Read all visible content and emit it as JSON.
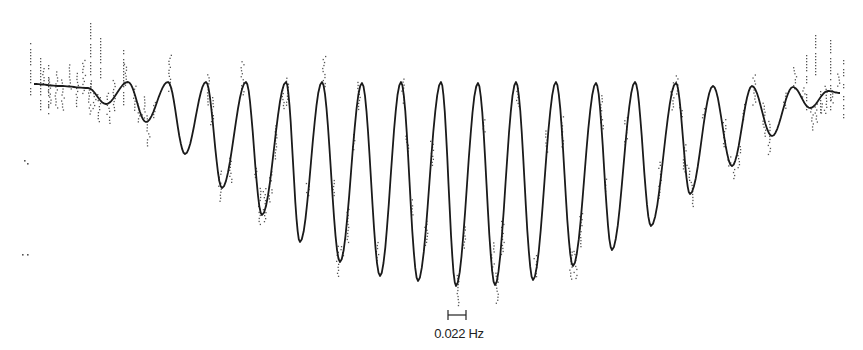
{
  "chart_data": {
    "type": "line",
    "title": "",
    "xlabel": "",
    "ylabel": "",
    "grid": false,
    "legend": null,
    "scale_bar": {
      "label": "0.022 Hz",
      "x_px": [
        448,
        466
      ],
      "y_px": 315
    },
    "series": [
      {
        "name": "fit",
        "style": "solid",
        "color": "#1a1a1a",
        "points_px": [
          [
            34,
            84
          ],
          [
            60,
            86
          ],
          [
            88,
            88
          ],
          [
            106,
            104
          ],
          [
            128,
            82
          ],
          [
            146,
            122
          ],
          [
            168,
            82
          ],
          [
            185,
            154
          ],
          [
            206,
            82
          ],
          [
            222,
            188
          ],
          [
            246,
            82
          ],
          [
            262,
            215
          ],
          [
            286,
            82
          ],
          [
            300,
            242
          ],
          [
            322,
            82
          ],
          [
            340,
            262
          ],
          [
            362,
            83
          ],
          [
            380,
            276
          ],
          [
            401,
            82
          ],
          [
            418,
            281
          ],
          [
            441,
            82
          ],
          [
            456,
            286
          ],
          [
            478,
            83
          ],
          [
            495,
            285
          ],
          [
            516,
            82
          ],
          [
            533,
            280
          ],
          [
            556,
            82
          ],
          [
            573,
            266
          ],
          [
            596,
            83
          ],
          [
            612,
            250
          ],
          [
            635,
            82
          ],
          [
            651,
            226
          ],
          [
            676,
            83
          ],
          [
            690,
            194
          ],
          [
            713,
            86
          ],
          [
            732,
            166
          ],
          [
            752,
            86
          ],
          [
            772,
            136
          ],
          [
            793,
            87
          ],
          [
            810,
            108
          ],
          [
            828,
            91
          ],
          [
            840,
            93
          ]
        ]
      }
    ],
    "peaks_x_px": [
      88,
      128,
      168,
      206,
      246,
      286,
      322,
      362,
      401,
      441,
      478,
      516,
      556,
      596,
      635,
      676,
      713,
      752,
      793,
      828
    ],
    "troughs": [
      {
        "x": 106,
        "y": 104
      },
      {
        "x": 146,
        "y": 122
      },
      {
        "x": 185,
        "y": 154
      },
      {
        "x": 222,
        "y": 188
      },
      {
        "x": 262,
        "y": 215
      },
      {
        "x": 300,
        "y": 242
      },
      {
        "x": 340,
        "y": 262
      },
      {
        "x": 380,
        "y": 276
      },
      {
        "x": 418,
        "y": 281
      },
      {
        "x": 456,
        "y": 286
      },
      {
        "x": 495,
        "y": 285
      },
      {
        "x": 533,
        "y": 280
      },
      {
        "x": 573,
        "y": 266
      },
      {
        "x": 612,
        "y": 250
      },
      {
        "x": 651,
        "y": 226
      },
      {
        "x": 690,
        "y": 194
      },
      {
        "x": 732,
        "y": 166
      },
      {
        "x": 772,
        "y": 136
      },
      {
        "x": 810,
        "y": 108
      }
    ],
    "cycles": 19
  },
  "labels": {
    "scale": "0.022 Hz"
  },
  "colors": {
    "ink": "#1a1a1a",
    "dots": "#555555",
    "background": "#ffffff"
  }
}
